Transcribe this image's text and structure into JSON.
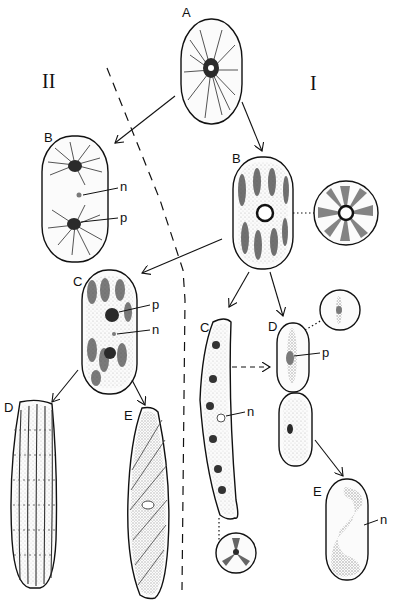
{
  "figure": {
    "sections": [
      {
        "id": "I",
        "label": "I"
      },
      {
        "id": "II",
        "label": "II"
      }
    ],
    "cells": {
      "A": {
        "label": "A"
      },
      "II_B": {
        "label": "B",
        "annotations": [
          "n",
          "p"
        ]
      },
      "II_C": {
        "label": "C",
        "annotations": [
          "p",
          "n"
        ]
      },
      "II_D": {
        "label": "D"
      },
      "II_E": {
        "label": "E"
      },
      "I_B": {
        "label": "B"
      },
      "I_C": {
        "label": "C",
        "annotations": [
          "n"
        ]
      },
      "I_D": {
        "label": "D",
        "annotations": [
          "p"
        ]
      },
      "I_E": {
        "label": "E",
        "annotations": [
          "n"
        ]
      }
    },
    "annotation_labels": {
      "nucleus": "n",
      "pyrenoid": "p"
    }
  }
}
